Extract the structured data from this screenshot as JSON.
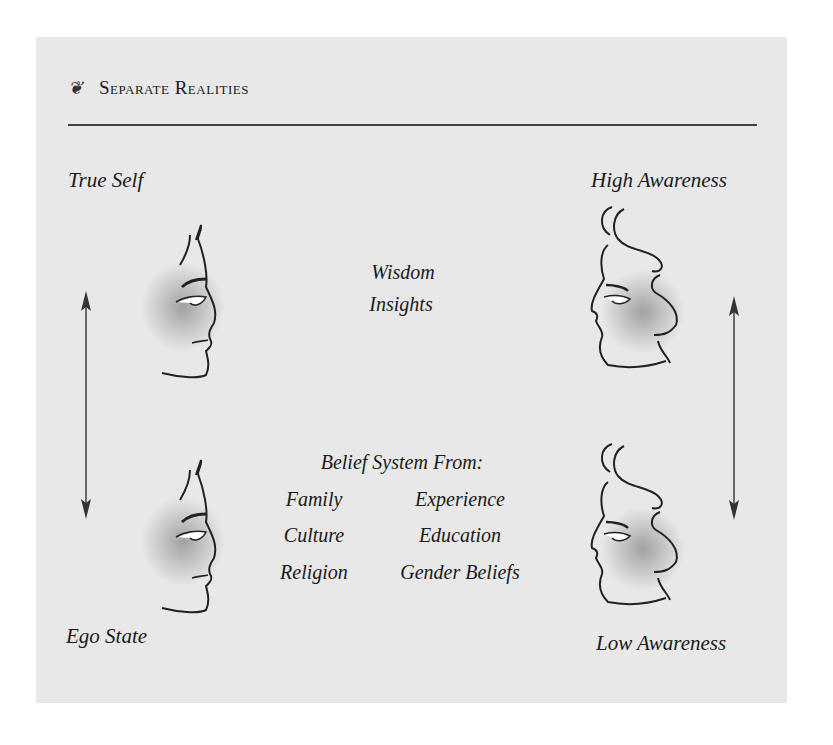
{
  "header": {
    "ornament": "❦",
    "title": "Separate Realities"
  },
  "left": {
    "top_label": "True Self",
    "bottom_label": "Ego State",
    "arrow": "bidirectional-vertical"
  },
  "right": {
    "top_label": "High Awareness",
    "bottom_label": "Low Awareness",
    "arrow": "bidirectional-vertical"
  },
  "center_top": {
    "lines": [
      "Wisdom",
      "Insights"
    ]
  },
  "center_bottom": {
    "heading": "Belief System From:",
    "left_column": [
      "Family",
      "Culture",
      "Religion"
    ],
    "right_column": [
      "Experience",
      "Education",
      "Gender Beliefs"
    ]
  },
  "colors": {
    "panel_background": "#e8e8e8",
    "rule": "#444444",
    "text": "#1a1a1a",
    "face_shadow": "#8a8a8a"
  }
}
